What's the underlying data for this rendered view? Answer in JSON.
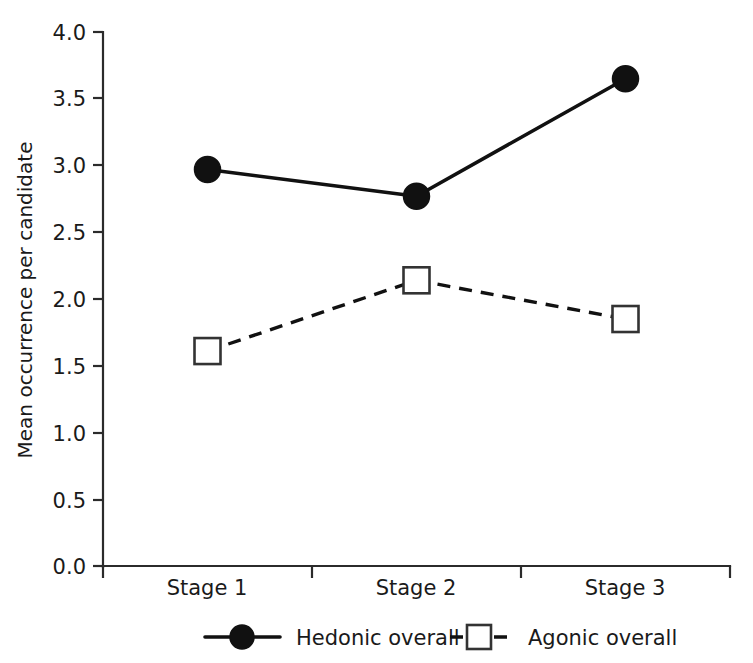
{
  "chart_data": {
    "type": "line",
    "title": "",
    "subtitle": "",
    "xlabel": "",
    "ylabel": "Mean occurrence per candidate",
    "categories": [
      "Stage 1",
      "Stage 2",
      "Stage 3"
    ],
    "series": [
      {
        "name": "Hedonic overall",
        "values": [
          2.97,
          2.77,
          3.65
        ],
        "line_style": "solid",
        "marker": "filled-circle",
        "color": "#111111"
      },
      {
        "name": "Agonic overall",
        "values": [
          1.61,
          2.14,
          1.85
        ],
        "line_style": "dashed",
        "marker": "open-square",
        "color": "#111111"
      }
    ],
    "ylim": [
      0.0,
      4.0
    ],
    "ytick_labels": [
      "0.0",
      "0.5",
      "1.0",
      "1.5",
      "2.0",
      "2.5",
      "3.0",
      "3.5",
      "4.0"
    ],
    "ytick_values": [
      0.0,
      0.5,
      1.0,
      1.5,
      2.0,
      2.5,
      3.0,
      3.5,
      4.0
    ],
    "xtick_labels": [
      "Stage 1",
      "Stage 2",
      "Stage 3"
    ],
    "grid": false,
    "legend_position": "bottom",
    "legend_entries": [
      "Hedonic overall",
      "Agonic overall"
    ]
  },
  "axes": {
    "y_title": "Mean occurrence per candidate",
    "ticks": {
      "y0": "0.0",
      "y1": "0.5",
      "y2": "1.0",
      "y3": "1.5",
      "y4": "2.0",
      "y5": "2.5",
      "y6": "3.0",
      "y7": "3.5",
      "y8": "4.0"
    },
    "x_categories": {
      "c0": "Stage 1",
      "c1": "Stage 2",
      "c2": "Stage 3"
    }
  },
  "legend": {
    "series1_label": "Hedonic overall",
    "series2_label": "Agonic overall"
  }
}
